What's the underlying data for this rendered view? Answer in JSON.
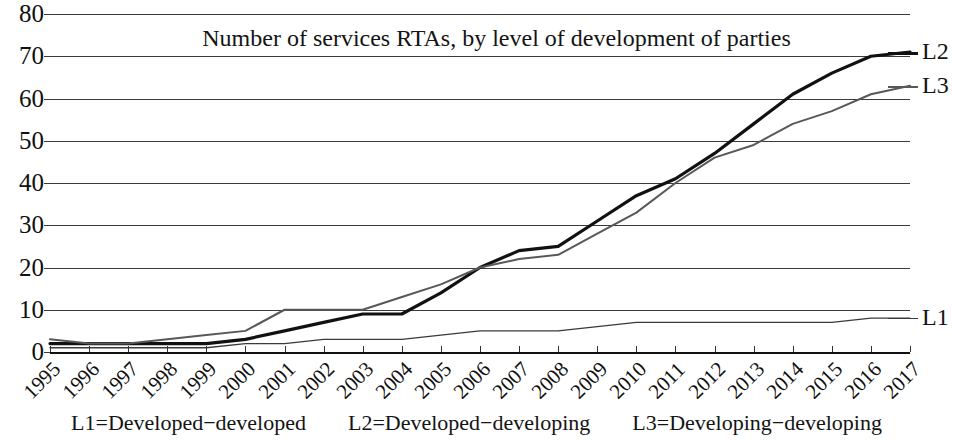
{
  "chart_data": {
    "type": "line",
    "title": "Number of services RTAs, by level of development of parties",
    "xlabel": "",
    "ylabel": "",
    "ylim": [
      0,
      80
    ],
    "ytick_step": 10,
    "yticks": [
      80,
      70,
      60,
      50,
      40,
      30,
      20,
      10,
      0
    ],
    "grid": true,
    "legend_position": "line-end-labels",
    "x": [
      1995,
      1996,
      1997,
      1998,
      1999,
      2000,
      2001,
      2002,
      2003,
      2004,
      2005,
      2006,
      2007,
      2008,
      2009,
      2010,
      2011,
      2012,
      2013,
      2014,
      2015,
      2016,
      2017
    ],
    "series": [
      {
        "name": "L1",
        "description": "L1=Developed−developed",
        "color": "#3a3a3a",
        "line_width": 1.3,
        "values": [
          1,
          1,
          1,
          1,
          1,
          2,
          2,
          3,
          3,
          3,
          4,
          5,
          5,
          5,
          6,
          7,
          7,
          7,
          7,
          7,
          7,
          8,
          8
        ]
      },
      {
        "name": "L2",
        "description": "L2=Developed−developing",
        "color": "#111111",
        "line_width": 3.2,
        "values": [
          2,
          2,
          2,
          2,
          2,
          3,
          5,
          7,
          9,
          9,
          14,
          20,
          24,
          25,
          31,
          37,
          41,
          47,
          54,
          61,
          66,
          70,
          71
        ]
      },
      {
        "name": "L3",
        "description": "L3=Developing−developing",
        "color": "#585858",
        "line_width": 2.0,
        "values": [
          3,
          2,
          2,
          3,
          4,
          5,
          10,
          10,
          10,
          13,
          16,
          20,
          22,
          23,
          28,
          33,
          40,
          46,
          49,
          54,
          57,
          61,
          63
        ]
      }
    ],
    "annotations": [
      {
        "text": "L2",
        "series": "L2",
        "at_x": 2017,
        "at_y": 71
      },
      {
        "text": "L3",
        "series": "L3",
        "at_x": 2017,
        "at_y": 63
      },
      {
        "text": "L1",
        "series": "L1",
        "at_x": 2017,
        "at_y": 8
      }
    ]
  },
  "footer": {
    "entries": [
      "L1=Developed−developed",
      "L2=Developed−developing",
      "L3=Developing−developing"
    ]
  },
  "series_labels": {
    "l2": "L2",
    "l3": "L3",
    "l1": "L1"
  }
}
